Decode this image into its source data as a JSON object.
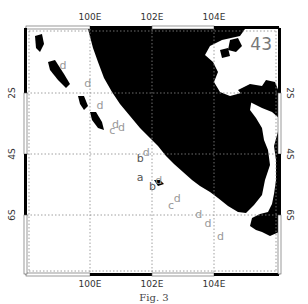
{
  "map": {
    "panel_number": "43",
    "x_ticks": [
      "100E",
      "102E",
      "104E"
    ],
    "y_ticks": [
      "2S",
      "4S",
      "6S"
    ],
    "x_tick_values": [
      100,
      102,
      104
    ],
    "y_tick_values": [
      -2,
      -4,
      -6
    ],
    "extent": {
      "lon": [
        97.9,
        106.1
      ],
      "lat": [
        -7.9,
        0.0
      ]
    },
    "land_color": "#000000",
    "sea_color": "#ffffff",
    "grid_color": "#888888",
    "marker_color": "#888888",
    "markers": [
      {
        "label": "d",
        "lon": 99.1,
        "lat": -1.3,
        "color": "#999999"
      },
      {
        "label": "d",
        "lon": 99.9,
        "lat": -1.9,
        "color": "#999999"
      },
      {
        "label": "d",
        "lon": 100.3,
        "lat": -2.6,
        "color": "#999999"
      },
      {
        "label": "d",
        "lon": 100.8,
        "lat": -3.2,
        "color": "#999999"
      },
      {
        "label": "c",
        "lon": 100.7,
        "lat": -3.4,
        "color": "#999999"
      },
      {
        "label": "d",
        "lon": 101.0,
        "lat": -3.3,
        "color": "#999999"
      },
      {
        "label": "d",
        "lon": 101.8,
        "lat": -4.1,
        "color": "#999999"
      },
      {
        "label": "b",
        "lon": 101.6,
        "lat": -4.3,
        "color": "#555555"
      },
      {
        "label": "a",
        "lon": 101.6,
        "lat": -4.9,
        "color": "#555555"
      },
      {
        "label": "d",
        "lon": 102.2,
        "lat": -5.0,
        "color": "#999999"
      },
      {
        "label": "b",
        "lon": 102.0,
        "lat": -5.2,
        "color": "#555555"
      },
      {
        "label": "d",
        "lon": 102.8,
        "lat": -5.6,
        "color": "#999999"
      },
      {
        "label": "c",
        "lon": 102.6,
        "lat": -5.8,
        "color": "#999999"
      },
      {
        "label": "d",
        "lon": 103.5,
        "lat": -6.1,
        "color": "#999999"
      },
      {
        "label": "d",
        "lon": 103.8,
        "lat": -6.4,
        "color": "#999999"
      },
      {
        "label": "d",
        "lon": 104.2,
        "lat": -6.8,
        "color": "#999999"
      }
    ]
  },
  "caption": "Fig. 3"
}
